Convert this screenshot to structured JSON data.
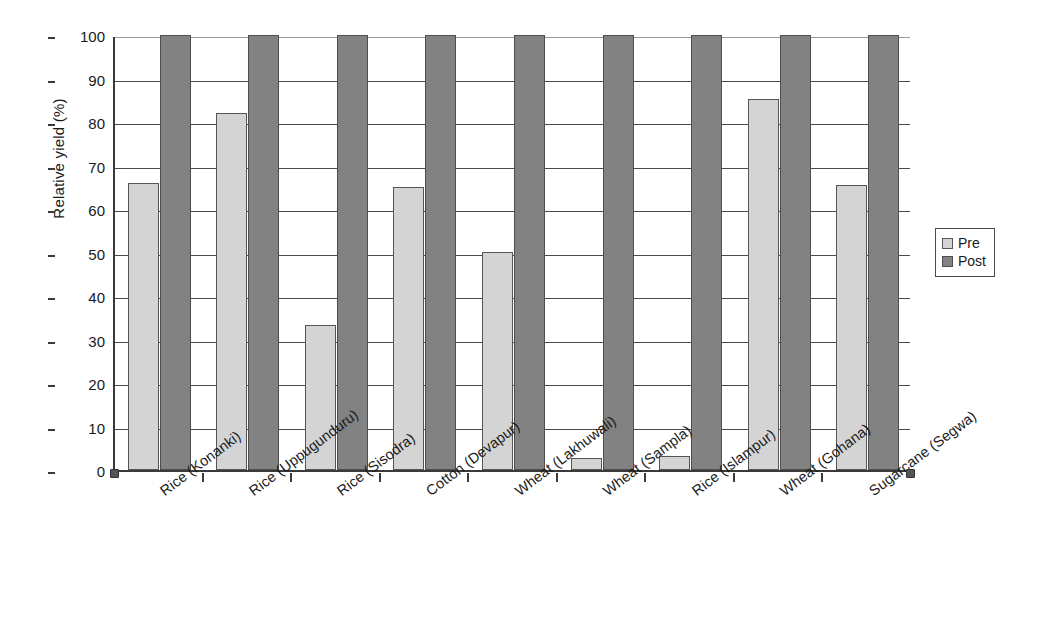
{
  "chart_data": {
    "type": "bar",
    "title": "",
    "xlabel": "",
    "ylabel": "Relative yield (%)",
    "ylim": [
      0,
      100
    ],
    "y_ticks": [
      0,
      10,
      20,
      30,
      40,
      50,
      60,
      70,
      80,
      90,
      100
    ],
    "grid": true,
    "legend_position": "right",
    "categories": [
      "Rice (Konanki)",
      "Rice (Uppugunduru)",
      "Rice (Sisodra)",
      "Cotton (Devapur)",
      "Wheat (Lakhuwali)",
      "Wheat (Sampla)",
      "Rice (Islampur)",
      "Wheat (Gohana)",
      "Sugarcane (Segwa)"
    ],
    "series": [
      {
        "name": "Pre",
        "color": "#d4d4d4",
        "values": [
          66,
          82,
          33.3,
          65,
          50.2,
          2.8,
          3.2,
          85.3,
          65.5
        ]
      },
      {
        "name": "Post",
        "color": "#828282",
        "values": [
          100,
          100,
          100,
          100,
          100,
          100,
          100,
          100,
          100
        ]
      }
    ]
  },
  "legend": {
    "items": [
      {
        "label": "Pre"
      },
      {
        "label": "Post"
      }
    ]
  }
}
